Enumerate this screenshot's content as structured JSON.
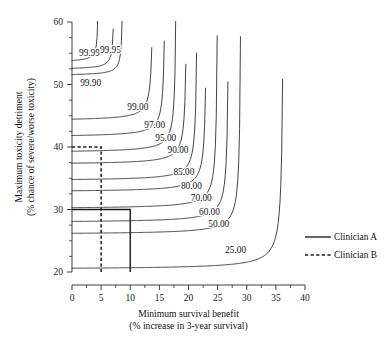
{
  "chart_data": {
    "type": "line",
    "title": "",
    "xlabel": "Minimum survival benefit",
    "xlabel_sub": "(% increase in 3-year survival)",
    "ylabel": "Maximum toxicity detriment",
    "ylabel_sub": "(% chance of severe/worse toxicity)",
    "xlim": [
      0,
      40
    ],
    "ylim": [
      20,
      60
    ],
    "xticks": [
      0,
      5,
      10,
      15,
      20,
      25,
      30,
      35,
      40
    ],
    "xtick_labels": [
      "0",
      "5",
      "10",
      "15",
      "20",
      "25",
      "30",
      "35",
      "40"
    ],
    "yticks": [
      20,
      30,
      40,
      50,
      60
    ],
    "ytick_labels": [
      "20",
      "30",
      "40",
      "50",
      "60"
    ],
    "ytick_minor": [
      22.5,
      25,
      27.5,
      32.5,
      35,
      37.5,
      42.5,
      45,
      47.5,
      52.5,
      55,
      57.5
    ],
    "grid": false,
    "legend_position": "right-middle",
    "contours": [
      {
        "level": "99.99",
        "label": "99.99",
        "label_x": 3.0,
        "label_y": 54.5,
        "h_asymptote": 53.6,
        "v_asymptote": 4.6,
        "curvature": 1.15
      },
      {
        "level": "99.95",
        "label": "99.95",
        "label_x": 6.6,
        "label_y": 55.0,
        "h_asymptote": 52.4,
        "v_asymptote": 7.3,
        "curvature": 1.45
      },
      {
        "level": "99.90",
        "label": "99.90",
        "label_x": 3.2,
        "label_y": 49.8,
        "h_asymptote": 51.4,
        "v_asymptote": 8.8,
        "curvature": 1.7
      },
      {
        "level": "99.00",
        "label": "99.00",
        "label_x": 11.3,
        "label_y": 46.0,
        "h_asymptote": 44.2,
        "v_asymptote": 14.0,
        "curvature": 3.6
      },
      {
        "level": "97.00",
        "label": "97.00",
        "label_x": 14.2,
        "label_y": 43.1,
        "h_asymptote": 41.6,
        "v_asymptote": 16.1,
        "curvature": 3.9
      },
      {
        "level": "95.00",
        "label": "95.00",
        "label_x": 16.1,
        "label_y": 40.9,
        "h_asymptote": 39.1,
        "v_asymptote": 18.0,
        "curvature": 4.1
      },
      {
        "level": "90.00",
        "label": "90.00",
        "label_x": 18.2,
        "label_y": 39.0,
        "h_asymptote": 37.2,
        "v_asymptote": 19.8,
        "curvature": 4.2
      },
      {
        "level": "85.00",
        "label": "85.00",
        "label_x": 19.2,
        "label_y": 35.5,
        "h_asymptote": 34.6,
        "v_asymptote": 21.6,
        "curvature": 4.4
      },
      {
        "level": "80.00",
        "label": "80.00",
        "label_x": 20.5,
        "label_y": 33.3,
        "h_asymptote": 32.8,
        "v_asymptote": 23.2,
        "curvature": 4.6
      },
      {
        "level": "70.00",
        "label": "70.00",
        "label_x": 22.2,
        "label_y": 31.3,
        "h_asymptote": 30.1,
        "v_asymptote": 25.1,
        "curvature": 4.9
      },
      {
        "level": "60.00",
        "label": "60.00",
        "label_x": 23.6,
        "label_y": 29.2,
        "h_asymptote": 27.9,
        "v_asymptote": 27.0,
        "curvature": 5.2
      },
      {
        "level": "50.00",
        "label": "50.00",
        "label_x": 25.2,
        "label_y": 27.2,
        "h_asymptote": 26.0,
        "v_asymptote": 29.1,
        "curvature": 5.6
      },
      {
        "level": "25.00",
        "label": "25.00",
        "label_x": 28.1,
        "label_y": 23.0,
        "h_asymptote": 20.4,
        "v_asymptote": 36.4,
        "curvature": 7.5
      }
    ],
    "reference_lines": [
      {
        "name": "Clinician A",
        "style": "solid",
        "x": 10,
        "y": 30
      },
      {
        "name": "Clinician B",
        "style": "dashed",
        "x": 5,
        "y": 40
      }
    ],
    "legend": [
      {
        "label": "Clinician A",
        "style": "solid"
      },
      {
        "label": "Clinician B",
        "style": "dashed"
      }
    ]
  }
}
